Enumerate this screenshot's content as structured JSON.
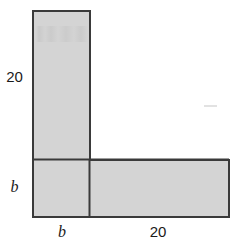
{
  "figure": {
    "name": "l-shaped-region",
    "shape": "L-shape composed of a tall vertical rectangle and a wide horizontal rectangle",
    "fill_color": "#d4d4d4",
    "stroke_color": "#3a3a3a",
    "stroke_width": 2,
    "background_color": "#ffffff",
    "outline_points": "33,11 90,11 90,160 229,160 229,217 33,217",
    "interior_divider": {
      "name": "corner-divider-line",
      "x1": 89,
      "y1": 160,
      "x2": 89,
      "y2": 217
    },
    "corner_line": {
      "name": "corner-horizontal-line",
      "x1": 33,
      "y1": 159,
      "x2": 229,
      "y2": 159
    }
  },
  "labels": {
    "height_top": "20",
    "height_bottom": "b",
    "width_left": "b",
    "width_right": "20"
  },
  "artifacts": {
    "top_noise": "faint-photocopy-noise",
    "right_dash": "faint-gray-dash"
  }
}
